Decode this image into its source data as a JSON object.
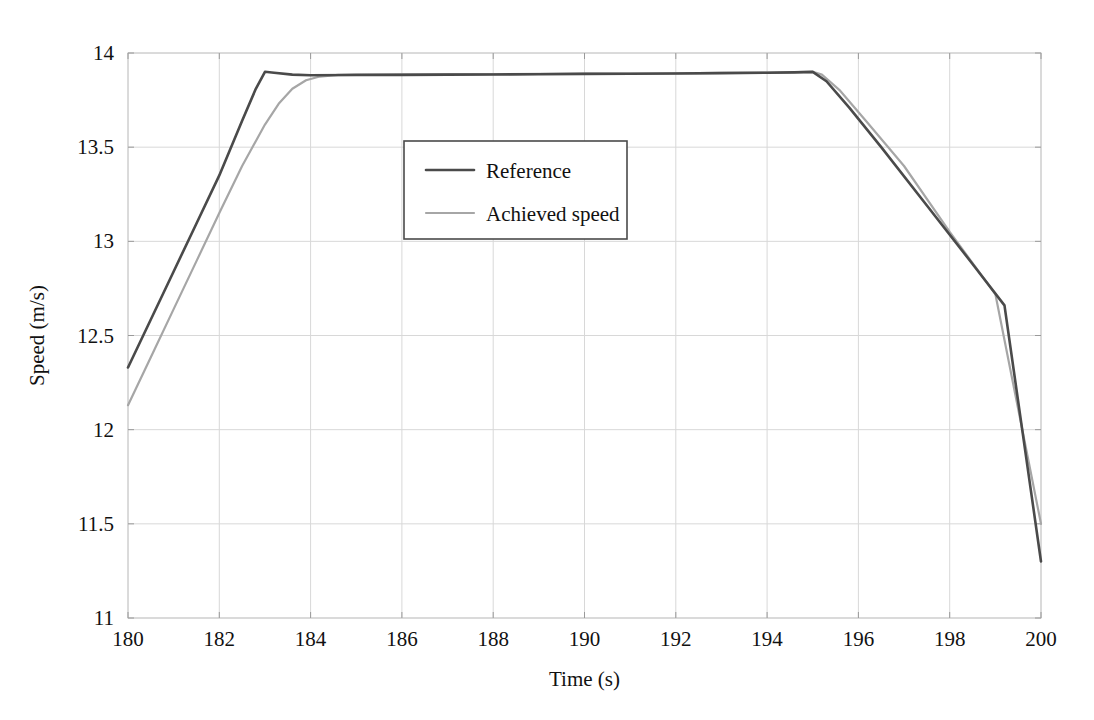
{
  "chart_data": {
    "type": "line",
    "title": "",
    "xlabel": "Time (s)",
    "ylabel": "Speed (m/s)",
    "xlim": [
      180,
      200
    ],
    "ylim": [
      11,
      14
    ],
    "grid": true,
    "legend_position": "upper-center-left",
    "x_ticks": [
      "180",
      "182",
      "184",
      "186",
      "188",
      "190",
      "192",
      "194",
      "196",
      "198",
      "200"
    ],
    "y_ticks": [
      "11",
      "11.5",
      "12",
      "12.5",
      "13",
      "13.5",
      "14"
    ],
    "series": [
      {
        "name": "Reference",
        "color": "#4a4a4a",
        "width": 2.6,
        "x": [
          180.0,
          180.5,
          181.0,
          181.5,
          182.0,
          182.5,
          182.8,
          183.0,
          183.2,
          183.6,
          184.0,
          185.0,
          186.0,
          187.0,
          188.0,
          189.0,
          190.0,
          191.0,
          192.0,
          193.0,
          194.0,
          194.6,
          195.0,
          195.3,
          195.8,
          196.5,
          197.5,
          198.5,
          199.2,
          200.0
        ],
        "y": [
          12.33,
          12.585,
          12.84,
          13.095,
          13.35,
          13.64,
          13.81,
          13.9,
          13.895,
          13.885,
          13.882,
          13.883,
          13.884,
          13.885,
          13.886,
          13.887,
          13.889,
          13.89,
          13.891,
          13.893,
          13.895,
          13.897,
          13.9,
          13.85,
          13.71,
          13.5,
          13.19,
          12.88,
          12.66,
          11.3
        ]
      },
      {
        "name": "Achieved speed",
        "color": "#a6a6a6",
        "width": 2.2,
        "x": [
          180.0,
          180.5,
          181.0,
          181.5,
          182.0,
          182.5,
          183.0,
          183.3,
          183.6,
          183.9,
          184.2,
          184.6,
          185.0,
          186.0,
          187.0,
          188.0,
          189.0,
          190.0,
          191.0,
          192.0,
          193.0,
          194.0,
          195.0,
          195.2,
          195.6,
          196.2,
          197.0,
          198.0,
          199.0,
          200.0
        ],
        "y": [
          12.13,
          12.385,
          12.64,
          12.895,
          13.15,
          13.4,
          13.62,
          13.73,
          13.81,
          13.855,
          13.875,
          13.884,
          13.886,
          13.886,
          13.887,
          13.888,
          13.889,
          13.89,
          13.891,
          13.892,
          13.894,
          13.896,
          13.9,
          13.885,
          13.8,
          13.63,
          13.4,
          13.05,
          12.72,
          11.5
        ]
      }
    ]
  },
  "legend": {
    "items": [
      {
        "label": "Reference"
      },
      {
        "label": "Achieved speed"
      }
    ]
  }
}
